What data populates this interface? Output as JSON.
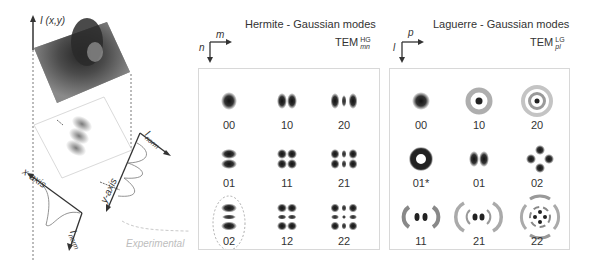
{
  "left_schematic": {
    "intensity_label": "I (x,y)",
    "x_axis_label": "x-axis",
    "y_axis_label": "y-axis",
    "x_profile_label": "I",
    "x_profile_sub": "norm",
    "y_profile_label": "I",
    "y_profile_sub": "norm",
    "experimental_label": "Experimental"
  },
  "hermite_panel": {
    "title": "Hermite - Gaussian modes",
    "tem_label": "TEM",
    "tem_sup": "HG",
    "tem_sub": "mn",
    "axis_h": "m",
    "axis_v": "n",
    "modes": [
      {
        "label": "00",
        "m": 0,
        "n": 0
      },
      {
        "label": "10",
        "m": 1,
        "n": 0
      },
      {
        "label": "20",
        "m": 2,
        "n": 0
      },
      {
        "label": "01",
        "m": 0,
        "n": 1
      },
      {
        "label": "11",
        "m": 1,
        "n": 1
      },
      {
        "label": "21",
        "m": 2,
        "n": 1
      },
      {
        "label": "02",
        "m": 0,
        "n": 2,
        "highlighted": true
      },
      {
        "label": "12",
        "m": 1,
        "n": 2
      },
      {
        "label": "22",
        "m": 2,
        "n": 2
      }
    ]
  },
  "laguerre_panel": {
    "title": "Laguerre - Gaussian modes",
    "tem_label": "TEM",
    "tem_sup": "LG",
    "tem_sub": "pl",
    "axis_h": "p",
    "axis_v": "l",
    "modes": [
      {
        "label": "00",
        "type": "gauss"
      },
      {
        "label": "10",
        "type": "ring1"
      },
      {
        "label": "20",
        "type": "ring2"
      },
      {
        "label": "01*",
        "type": "donut"
      },
      {
        "label": "01",
        "type": "two-lobe"
      },
      {
        "label": "02",
        "type": "four-lobe"
      },
      {
        "label": "11",
        "type": "lobes-arcs1"
      },
      {
        "label": "21",
        "type": "lobes-arcs2"
      },
      {
        "label": "22",
        "type": "complex"
      }
    ]
  },
  "colors": {
    "ink": "#333333",
    "panel_border": "#d8d8d8",
    "dashed": "#9a9a9a",
    "experimental": "#bdbdbd"
  }
}
